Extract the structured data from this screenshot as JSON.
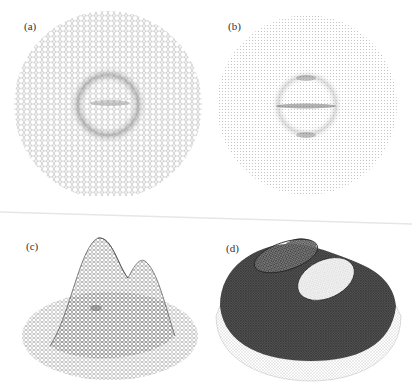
{
  "figure": {
    "panels": [
      {
        "id": "a",
        "label": "(a)",
        "description": "top view of planar triangle mesh with circular boundary, fine wireframe"
      },
      {
        "id": "b",
        "label": "(b)",
        "description": "top view of lighter, denser planar mesh with circular boundary"
      },
      {
        "id": "c",
        "label": "(c)",
        "description": "3D wireframe surface with two peaks over circular base"
      },
      {
        "id": "d",
        "label": "(d)",
        "description": "3D shaded dense mesh dome with two flattened elliptical caps"
      }
    ]
  },
  "colors": {
    "background": "#ffffff",
    "mesh_light": "#9a9a9a",
    "mesh_dark": "#2a2a2a",
    "label": "#333333"
  }
}
